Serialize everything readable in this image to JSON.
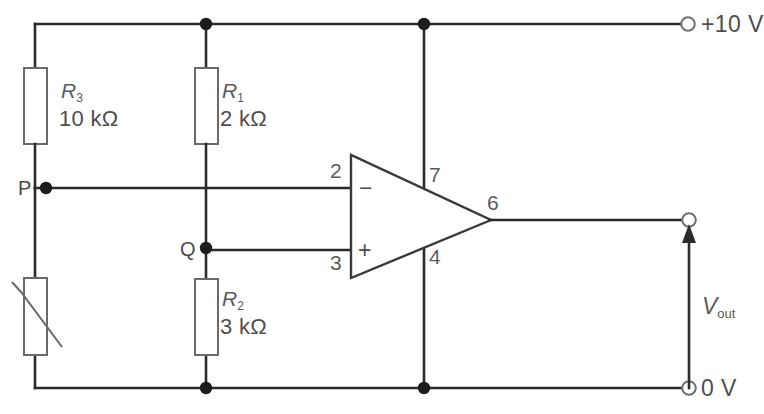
{
  "diagram": {
    "type": "circuit-schematic",
    "background_color": "#ffffff",
    "wire_color": "#2b2b2b",
    "text_color": "#5d5d5d"
  },
  "components": {
    "r3": {
      "name": "R",
      "subscript": "3",
      "value": "10 kΩ",
      "kind": "resistor"
    },
    "r1": {
      "name": "R",
      "subscript": "1",
      "value": "2 kΩ",
      "kind": "resistor"
    },
    "r2": {
      "name": "R",
      "subscript": "2",
      "value": "3 kΩ",
      "kind": "resistor"
    },
    "thermistor": {
      "name": "",
      "value": "",
      "kind": "thermistor"
    },
    "opamp": {
      "kind": "operational-amplifier",
      "inverting_sign": "−",
      "noninverting_sign": "+",
      "pins": {
        "inverting": "2",
        "noninverting": "3",
        "positive_supply": "7",
        "negative_supply": "4",
        "output": "6"
      }
    }
  },
  "nodes": {
    "p": "P",
    "q": "Q"
  },
  "terminals": {
    "supply_positive": "+10 V",
    "supply_zero": "0 V",
    "output_label": "V",
    "output_subscript": "out"
  }
}
